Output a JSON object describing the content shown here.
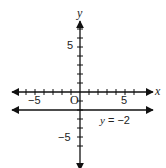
{
  "header_fragment": "...",
  "chart_data": {
    "type": "line",
    "title": "",
    "xlabel": "x",
    "ylabel": "y",
    "xlim": [
      -8,
      7
    ],
    "ylim": [
      -8,
      9
    ],
    "x_ticks": [
      -5,
      5
    ],
    "y_ticks": [
      5,
      -5
    ],
    "origin_label": "O",
    "grid": false,
    "series": [
      {
        "name": "y = -2",
        "type": "horizontal_line",
        "y": -2,
        "label": "y = −2"
      }
    ]
  },
  "labels": {
    "x_axis": "x",
    "y_axis": "y",
    "origin": "O",
    "x_neg5": "−5",
    "x_pos5": "5",
    "y_pos5": "5",
    "y_neg5": "−5",
    "line_label": "y = −2"
  }
}
